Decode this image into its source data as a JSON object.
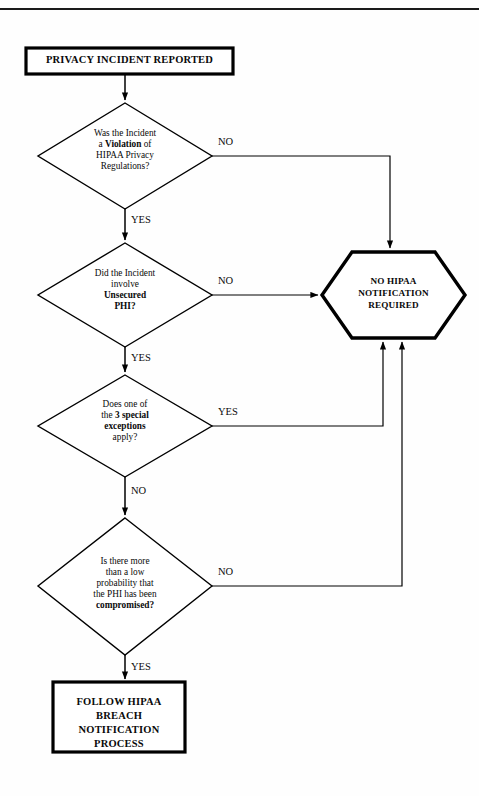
{
  "document": {
    "title": "HIPAA Privacy Incident Breach Notification Decision Flowchart",
    "header_rule": true
  },
  "nodes": {
    "start": {
      "type": "terminator",
      "label": "PRIVACY INCIDENT REPORTED"
    },
    "decision1": {
      "type": "decision",
      "line1": "Was the Incident",
      "line2_pre": "a ",
      "line2_bold": "Violation",
      "line2_post": " of",
      "line3": "HIPAA Privacy",
      "line4": "Regulations?"
    },
    "decision2": {
      "type": "decision",
      "line1": "Did the Incident",
      "line2": "involve",
      "line3_bold": "Unsecured",
      "line4_bold": "PHI?"
    },
    "decision3": {
      "type": "decision",
      "line1": "Does one of",
      "line2_pre": "the ",
      "line2_bold": "3 special",
      "line3_bold": "exceptions",
      "line4": "apply?"
    },
    "decision4": {
      "type": "decision",
      "line1": "Is there more",
      "line2": "than a low",
      "line3": "probability that",
      "line4": "the PHI has been",
      "line5_bold": "compromised?"
    },
    "outcome_no_notification": {
      "type": "hexagon",
      "line1": "NO HIPAA",
      "line2": "NOTIFICATION",
      "line3": "REQUIRED"
    },
    "outcome_follow_process": {
      "type": "terminator",
      "line1": "FOLLOW HIPAA",
      "line2": "BREACH",
      "line3": "NOTIFICATION",
      "line4": "PROCESS"
    }
  },
  "edges": {
    "d1_no": "NO",
    "d1_yes": "YES",
    "d2_no": "NO",
    "d2_yes": "YES",
    "d3_yes": "YES",
    "d3_no": "NO",
    "d4_no": "NO",
    "d4_yes": "YES"
  },
  "colors": {
    "stroke": "#000000",
    "background": "#ffffff",
    "text": "#0a0a0a"
  }
}
